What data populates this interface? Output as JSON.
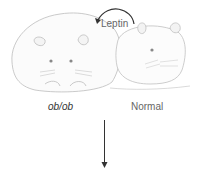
{
  "figure": {
    "labels": {
      "obese_mouse": "ob/ob",
      "normal_mouse": "Normal",
      "hormone": "Leptin"
    },
    "icons": {
      "obese_mouse": "obese-mouse-illustration",
      "normal_mouse": "normal-mouse-illustration",
      "leptin_arrow": "curved-arrow-icon",
      "down_arrow": "arrow-down-icon"
    },
    "colors": {
      "line": "#b0b0b0",
      "arrow": "#333333",
      "text": "#666666"
    }
  }
}
